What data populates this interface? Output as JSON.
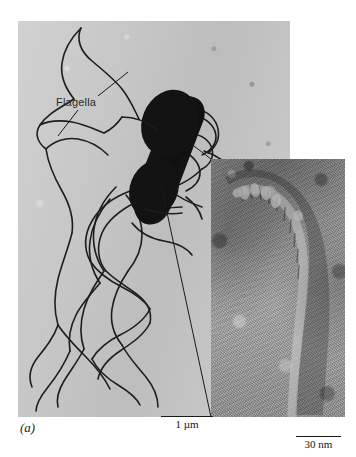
{
  "figure": {
    "panel_label": "(a)",
    "annotations": [
      {
        "id": "flagella",
        "text": "Flagella"
      }
    ],
    "scale_bars": [
      {
        "id": "micron",
        "label": "1 µm",
        "length_px": 52,
        "panel": "main-micrograph"
      },
      {
        "id": "nanometer",
        "label": "30 nm",
        "length_px": 45,
        "panel": "inset-micrograph"
      }
    ]
  },
  "panels": {
    "main": {
      "name": "main-micrograph",
      "subject": "peritrichously flagellated rod-shaped bacterium",
      "background_color": "#c9c9c9",
      "cell_color": "#141414"
    },
    "inset": {
      "name": "inset-micrograph",
      "subject": "high-magnification flagellar filament and hook",
      "background_color": "#9a9a9a"
    }
  },
  "colors": {
    "page_background": "#ffffff",
    "ink": "#1a1a1a",
    "main_panel": "#c9c9c9",
    "inset_panel": "#9a9a9a"
  }
}
